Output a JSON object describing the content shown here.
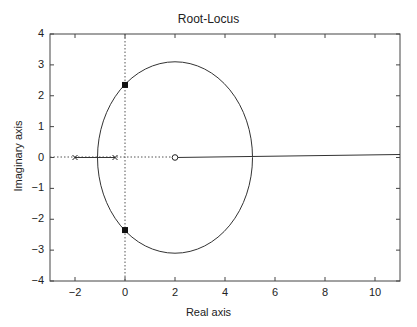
{
  "chart_data": {
    "type": "line",
    "title": "Root-Locus",
    "xlabel": "Real axis",
    "ylabel": "Imaginary axis",
    "xlim": [
      -3,
      11
    ],
    "ylim": [
      -4,
      4
    ],
    "xticks": [
      -2,
      0,
      2,
      4,
      6,
      8,
      10
    ],
    "yticks": [
      4,
      3,
      2,
      1,
      0,
      -1,
      -2,
      -3,
      -4
    ],
    "grid": false,
    "poles": [
      {
        "re": -2,
        "im": 0
      },
      {
        "re": -0.4,
        "im": 0
      }
    ],
    "zeros": [
      {
        "re": 2,
        "im": 0
      }
    ],
    "imag_axis_crossings": [
      {
        "re": 0,
        "im": 2.35
      },
      {
        "re": 0,
        "im": -2.35
      }
    ],
    "locus_circle": {
      "center_re": 2.0,
      "center_im": 0,
      "radius_re": 3.1,
      "radius_im": 3.1
    },
    "real_axis_segments": [
      {
        "from": -2,
        "to": -0.4
      },
      {
        "from": 2,
        "to": 11
      }
    ]
  },
  "labels": {
    "title": "Root-Locus",
    "xlabel": "Real axis",
    "ylabel": "Imaginary axis",
    "xticks": [
      "-2",
      "0",
      "2",
      "4",
      "6",
      "8",
      "10"
    ],
    "yticks": [
      "4",
      "3",
      "2",
      "1",
      "0",
      "-1",
      "-2",
      "-3",
      "-4"
    ]
  }
}
